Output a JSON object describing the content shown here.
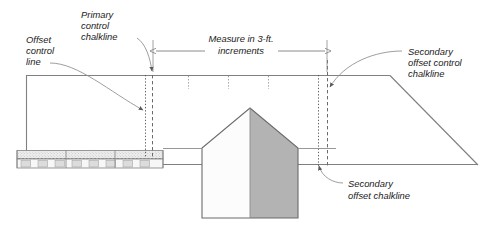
{
  "figure": {
    "background_color": "#ffffff",
    "line_color": "#808080",
    "dark_line_color": "#595959",
    "text_color": "#1a1a1a"
  },
  "labels": {
    "offset_control_line": {
      "line1": "Offset",
      "line2": "control",
      "line3": "line"
    },
    "primary_control_chalkline": {
      "line1": "Primary",
      "line2": "control",
      "line3": "chalkline"
    },
    "measure_increments": {
      "line1": "Measure in 3-ft.",
      "line2": "increments"
    },
    "secondary_offset_control_chalkline": {
      "line1": "Secondary",
      "line2": "offset control",
      "line3": "chalkline"
    },
    "secondary_offset_chalkline": {
      "line1": "Secondary",
      "line2": "offset chalkline"
    }
  },
  "measurement": {
    "spacing_value": "3",
    "spacing_unit": "ft.",
    "tick_count": "3"
  },
  "shapes": {
    "roof_plane_fill": "#ffffff",
    "gable_left_fill": "#fbfbfb",
    "gable_right_fill": "#b3b3b3",
    "shingle_band_top_fill": "#ededed",
    "shingle_band_bottom_fill": "#f2f2f2",
    "shingle_block_fill": "#dcdcdc"
  }
}
